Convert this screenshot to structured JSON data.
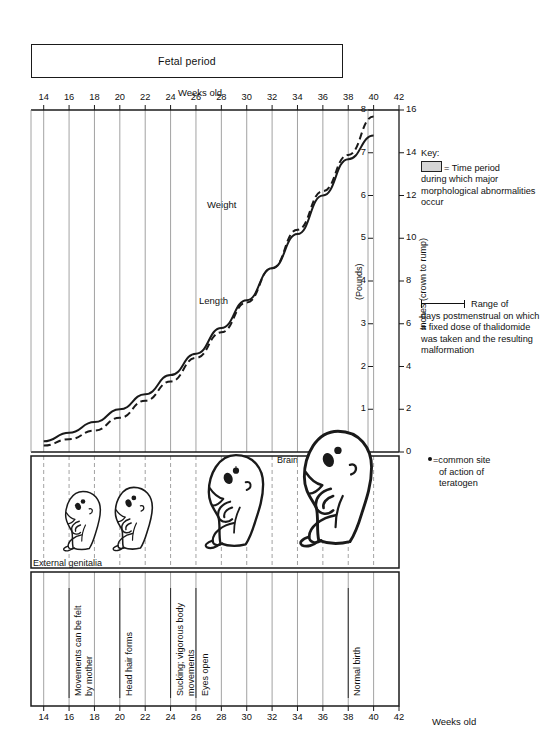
{
  "banner": {
    "label": "Fetal period"
  },
  "axes": {
    "x_title_top": "Weeks old",
    "x_title_bottom": "Weeks old",
    "x_ticks": [
      14,
      16,
      18,
      20,
      22,
      24,
      26,
      28,
      30,
      32,
      34,
      36,
      38,
      40,
      42
    ],
    "y_left_title": "(Pounds)",
    "y_left_ticks": [
      0,
      1,
      2,
      3,
      4,
      5,
      6,
      7,
      8
    ],
    "y_right_title": "Inches (crown to rump)",
    "y_right_ticks": [
      0,
      2,
      4,
      6,
      8,
      10,
      12,
      14,
      16
    ]
  },
  "series_labels": {
    "weight": "Weight",
    "length": "Length"
  },
  "key": {
    "title": "Key:",
    "swatch_text": "= Time period",
    "swatch_body": "during which major morphological abnormalities occur",
    "range_text": "Range of",
    "range_body": "days postmenstrual on which a fixed dose of thalidomide was taken and the resulting malformation",
    "teratogen_text": "=common site",
    "teratogen_line2": "of action of",
    "teratogen_line3": "teratogen"
  },
  "annotations": {
    "brain": "Brain",
    "external_genitalia": "External genitalia"
  },
  "milestones": [
    {
      "week": 16,
      "lines": [
        "Movements can be felt",
        "by mother"
      ]
    },
    {
      "week": 20,
      "lines": [
        "Head hair forms"
      ]
    },
    {
      "week": 24,
      "lines": [
        "Sucking; vigorous body",
        "movements"
      ]
    },
    {
      "week": 26,
      "lines": [
        "Eyes open"
      ]
    },
    {
      "week": 38,
      "lines": [
        "Normal birth"
      ]
    }
  ],
  "colors": {
    "ink": "#1a1a1a",
    "gridline": "#8a8a8a",
    "swatch": "#d6d6d6"
  },
  "chart_data": {
    "type": "line",
    "xlabel": "Weeks old",
    "ylabel": "(Pounds)",
    "ylabel_right": "Inches (crown to rump)",
    "xlim": [
      13,
      42
    ],
    "ylim": [
      0,
      8
    ],
    "ylim_right": [
      0,
      16
    ],
    "grid": true,
    "legend": "inline-labels",
    "x": [
      14,
      16,
      18,
      20,
      22,
      24,
      26,
      28,
      30,
      32,
      34,
      36,
      38,
      40
    ],
    "series": [
      {
        "name": "Weight",
        "unit": "pounds",
        "style": "solid",
        "values": [
          0.25,
          0.45,
          0.7,
          1.0,
          1.35,
          1.8,
          2.3,
          2.9,
          3.55,
          4.3,
          5.1,
          6.0,
          6.85,
          7.4
        ]
      },
      {
        "name": "Length",
        "unit": "inches (crown to rump)",
        "style": "dashed",
        "values": [
          0.3,
          0.6,
          1.0,
          1.6,
          2.4,
          3.3,
          4.4,
          5.6,
          7.0,
          8.6,
          10.4,
          12.2,
          13.9,
          15.7
        ]
      }
    ]
  }
}
